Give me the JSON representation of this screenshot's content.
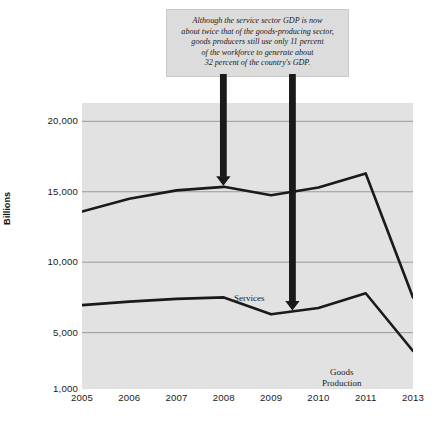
{
  "callout": {
    "lines": [
      "Although the service sector GDP is now",
      "about twice that of the goods-producing sector,",
      "goods producers still use only 11 percent",
      "of the workforce to generate about",
      "32 percent of the country's GDP."
    ]
  },
  "annotations": {
    "arrow_to_services": "arrow-down-icon",
    "arrow_to_goods": "arrow-down-icon"
  },
  "chart_data": {
    "type": "line",
    "title": "",
    "subtitle": "",
    "xlabel": "",
    "ylabel": "Billions",
    "x": [
      "2005",
      "2006",
      "2007",
      "2008",
      "2009",
      "2010",
      "2011",
      "2013"
    ],
    "xtick_labels": [
      "2005",
      "2006",
      "2007",
      "2008",
      "2009",
      "2010",
      "2011",
      "2013"
    ],
    "ytick_labels": [
      "20,000",
      "15,000",
      "10,000",
      "5,000",
      "1,000"
    ],
    "ytick_values": [
      20000,
      15000,
      10000,
      5000,
      1000
    ],
    "ylim": [
      1000,
      21300
    ],
    "xlim": [
      2005,
      2013
    ],
    "grid": true,
    "grid_axis": "y",
    "legend": "inline-labels",
    "plot_background": "#e2e2e2",
    "line_color": "#1a1a1a",
    "series": [
      {
        "name": "Services",
        "label": "Services",
        "values": [
          13600,
          14500,
          15100,
          15350,
          14750,
          15300,
          16300,
          7500
        ]
      },
      {
        "name": "Goods Production",
        "label": "Goods\nProduction",
        "label_line1": "Goods",
        "label_line2": "Production",
        "values": [
          6950,
          7200,
          7400,
          7500,
          6300,
          6750,
          7800,
          3700
        ]
      }
    ],
    "annotations": [
      {
        "text": "arrow pointing to Services line",
        "x": "2008",
        "target_series": "Services"
      },
      {
        "text": "arrow pointing to Goods Production line",
        "x": "2009.5",
        "target_series": "Goods Production"
      }
    ]
  }
}
